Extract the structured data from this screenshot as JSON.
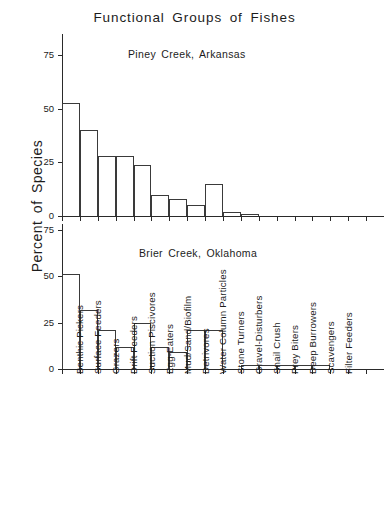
{
  "chart_data": {
    "type": "bar",
    "title": "Functional Groups of Fishes",
    "xlabel": "",
    "ylabel": "Percent of Species",
    "grid": false,
    "legend": "none",
    "orientation": "vertical",
    "panels": [
      {
        "subtitle": "Piney Creek, Arkansas",
        "ylim": [
          0,
          85
        ],
        "yticks": [
          0,
          25,
          50,
          75
        ],
        "ytick_labels": [
          "0",
          "25",
          "50",
          "75"
        ],
        "values": [
          53,
          40,
          28,
          28,
          24,
          10,
          8,
          5,
          15,
          2,
          1,
          0,
          0,
          0,
          0,
          0
        ]
      },
      {
        "subtitle": "Brier Creek, Oklahoma",
        "ylim": [
          0,
          78
        ],
        "yticks": [
          0,
          25,
          50,
          75
        ],
        "ytick_labels": [
          "0",
          "25",
          "50",
          "75"
        ],
        "values": [
          51,
          32,
          21,
          12,
          25,
          12,
          9,
          21,
          21,
          0,
          2,
          2,
          2,
          2,
          2,
          0
        ]
      }
    ],
    "categories": [
      "Benthic Pickers",
      "Surface Feeders",
      "Grazers",
      "Drift Feeders",
      "Suction Piscivores",
      "Egg-Eaters",
      "Mud/Sand/Biofilm",
      "Detrivores",
      "Water Column Particles",
      "Stone Turners",
      "Gravel-Disturbers",
      "Snail Crush",
      "Prey Biters",
      "Deep Burrowers",
      "Scavengers",
      "Filter Feeders"
    ]
  },
  "colors": {
    "ink": "#1c1c1c",
    "axis": "#2a2a2a",
    "bar_stroke": "#3a3a3a",
    "background": "#ffffff"
  }
}
